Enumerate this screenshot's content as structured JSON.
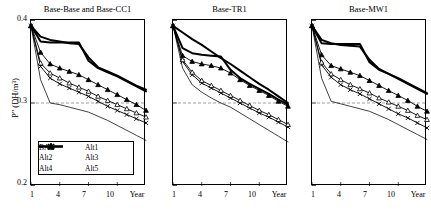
{
  "figure": {
    "axis_title_y": "P\" (DH/m³)",
    "y_ticks": [
      "0.4",
      "0.3",
      "0.2"
    ],
    "x_ticks": [
      "1",
      "4",
      "7",
      "10",
      "Year"
    ],
    "reference_line_value": "0.3",
    "colors": {
      "line": "#000000",
      "reference": "#888888",
      "frame": "#000000"
    }
  },
  "legend": {
    "entries": [
      {
        "label": "BAU",
        "marker": "x-cross",
        "weight": "thin"
      },
      {
        "label": "Alt1",
        "marker": "none",
        "weight": "thick"
      },
      {
        "label": "Alt2",
        "marker": "open-triangle",
        "weight": "thin"
      },
      {
        "label": "Alt3",
        "marker": "filled-triangle",
        "weight": "thin"
      },
      {
        "label": "Alt4",
        "marker": "none",
        "weight": "thick"
      },
      {
        "label": "Alt5",
        "marker": "none",
        "weight": "thin"
      }
    ]
  },
  "chart_data": {
    "type": "line",
    "xlabel": "Year",
    "ylabel": "P\" (DH/m³)",
    "ylim": [
      0.2,
      0.4
    ],
    "xlim": [
      1,
      13
    ],
    "y_tick_values": [
      0.2,
      0.3,
      0.4
    ],
    "x_tick_values": [
      1,
      4,
      7,
      10
    ],
    "grid": false,
    "legend_position": "inside-bottom-left-panel-1",
    "reference_lines": [
      {
        "y": 0.3,
        "style": "dashed",
        "color": "#888888"
      }
    ],
    "panels": [
      {
        "title": "Base-Base and Base-CC1",
        "x": [
          1,
          2,
          3,
          4,
          5,
          6,
          7,
          8,
          9,
          10,
          11,
          12,
          13
        ],
        "series": [
          {
            "name": "BAU",
            "marker": "x-cross",
            "values": [
              0.393,
              0.344,
              0.33,
              0.323,
              0.318,
              0.313,
              0.308,
              0.302,
              0.296,
              0.291,
              0.286,
              0.281,
              0.276
            ]
          },
          {
            "name": "Alt1",
            "marker": "none",
            "values": [
              0.393,
              0.38,
              0.376,
              0.374,
              0.372,
              0.371,
              0.355,
              0.343,
              0.338,
              0.333,
              0.327,
              0.321,
              0.316
            ]
          },
          {
            "name": "Alt2",
            "marker": "open-triangle",
            "values": [
              0.393,
              0.348,
              0.336,
              0.33,
              0.324,
              0.319,
              0.314,
              0.308,
              0.303,
              0.298,
              0.293,
              0.288,
              0.283
            ]
          },
          {
            "name": "Alt3",
            "marker": "filled-triangle",
            "values": [
              0.393,
              0.361,
              0.347,
              0.342,
              0.338,
              0.334,
              0.328,
              0.322,
              0.316,
              0.31,
              0.304,
              0.298,
              0.291
            ]
          },
          {
            "name": "Alt4",
            "marker": "none",
            "values": [
              0.393,
              0.374,
              0.373,
              0.373,
              0.373,
              0.373,
              0.351,
              0.342,
              0.337,
              0.332,
              0.326,
              0.32,
              0.314
            ]
          },
          {
            "name": "Alt5",
            "marker": "none",
            "values": [
              0.393,
              0.328,
              0.3,
              0.298,
              0.295,
              0.292,
              0.289,
              0.284,
              0.279,
              0.273,
              0.267,
              0.261,
              0.255
            ]
          }
        ]
      },
      {
        "title": "Base-TR1",
        "x": [
          1,
          2,
          3,
          4,
          5,
          6,
          7,
          8,
          9,
          10,
          11,
          12,
          13
        ],
        "series": [
          {
            "name": "BAU",
            "marker": "x-cross",
            "values": [
              0.393,
              0.35,
              0.334,
              0.324,
              0.318,
              0.312,
              0.306,
              0.3,
              0.294,
              0.288,
              0.283,
              0.277,
              0.271
            ]
          },
          {
            "name": "Alt1",
            "marker": "none",
            "values": [
              0.393,
              0.385,
              0.377,
              0.37,
              0.362,
              0.354,
              0.347,
              0.339,
              0.331,
              0.323,
              0.316,
              0.308,
              0.3
            ]
          },
          {
            "name": "Alt2",
            "marker": "open-triangle",
            "values": [
              0.393,
              0.352,
              0.337,
              0.327,
              0.321,
              0.315,
              0.309,
              0.303,
              0.297,
              0.291,
              0.286,
              0.28,
              0.274
            ]
          },
          {
            "name": "Alt3",
            "marker": "filled-triangle",
            "values": [
              0.393,
              0.357,
              0.35,
              0.347,
              0.345,
              0.342,
              0.336,
              0.328,
              0.321,
              0.315,
              0.309,
              0.302,
              0.296
            ]
          },
          {
            "name": "Alt4",
            "marker": "none",
            "values": [
              0.393,
              0.366,
              0.36,
              0.358,
              0.357,
              0.356,
              0.34,
              0.33,
              0.323,
              0.317,
              0.311,
              0.304,
              0.298
            ]
          },
          {
            "name": "Alt5",
            "marker": "none",
            "values": [
              0.393,
              0.342,
              0.322,
              0.313,
              0.306,
              0.3,
              0.295,
              0.288,
              0.281,
              0.274,
              0.267,
              0.26,
              0.253
            ]
          }
        ]
      },
      {
        "title": "Base-MW1",
        "x": [
          1,
          2,
          3,
          4,
          5,
          6,
          7,
          8,
          9,
          10,
          11,
          12,
          13
        ],
        "series": [
          {
            "name": "BAU",
            "marker": "x-cross",
            "values": [
              0.393,
              0.346,
              0.331,
              0.322,
              0.316,
              0.311,
              0.305,
              0.299,
              0.293,
              0.287,
              0.282,
              0.276,
              0.27
            ]
          },
          {
            "name": "Alt1",
            "marker": "none",
            "values": [
              0.393,
              0.376,
              0.372,
              0.37,
              0.369,
              0.368,
              0.352,
              0.341,
              0.335,
              0.329,
              0.323,
              0.317,
              0.311
            ]
          },
          {
            "name": "Alt2",
            "marker": "open-triangle",
            "values": [
              0.393,
              0.349,
              0.335,
              0.328,
              0.322,
              0.317,
              0.312,
              0.306,
              0.301,
              0.296,
              0.291,
              0.285,
              0.28
            ]
          },
          {
            "name": "Alt3",
            "marker": "filled-triangle",
            "values": [
              0.393,
              0.358,
              0.345,
              0.341,
              0.337,
              0.333,
              0.327,
              0.321,
              0.315,
              0.309,
              0.303,
              0.296,
              0.29
            ]
          },
          {
            "name": "Alt4",
            "marker": "none",
            "values": [
              0.393,
              0.372,
              0.371,
              0.371,
              0.371,
              0.371,
              0.349,
              0.34,
              0.335,
              0.33,
              0.324,
              0.318,
              0.312
            ]
          },
          {
            "name": "Alt5",
            "marker": "none",
            "values": [
              0.393,
              0.33,
              0.302,
              0.299,
              0.296,
              0.293,
              0.29,
              0.285,
              0.28,
              0.274,
              0.268,
              0.262,
              0.256
            ]
          }
        ]
      }
    ]
  }
}
